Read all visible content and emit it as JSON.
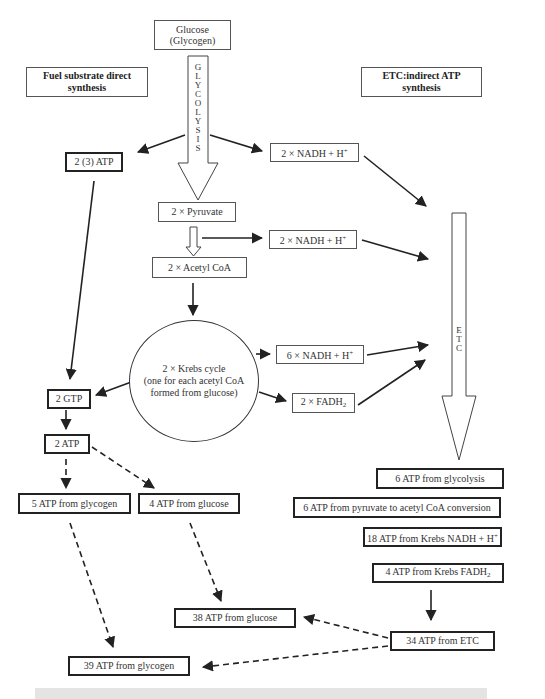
{
  "diagram": {
    "source": {
      "line1": "Glucose",
      "line2": "(Glycogen)"
    },
    "headers": {
      "left": "Fuel substrate direct synthesis",
      "right": "ETC:indirect ATP synthesis"
    },
    "glycolysis_label": [
      "G",
      "L",
      "Y",
      "C",
      "O",
      "L",
      "Y",
      "S",
      "I",
      "S"
    ],
    "etc_label": [
      "E",
      "T",
      "C"
    ],
    "nodes": {
      "atp_glycolysis": "2 (3) ATP",
      "nadh_glycolysis": "2 × NADH + H",
      "pyruvate": "2 × Pyruvate",
      "nadh_pyruvate": "2 × NADH + H",
      "acetyl_coa": "2 × Acetyl CoA",
      "krebs_line1": "2 × Krebs cycle",
      "krebs_line2": "(one for each acetyl CoA",
      "krebs_line3": "formed from glucose)",
      "nadh_krebs": "6 × NADH + H",
      "fadh2_krebs": "2 × FADH",
      "gtp": "2 GTP",
      "atp_from_gtp": "2 ATP",
      "atp_glycogen_direct": "5 ATP from glycogen",
      "atp_glucose_direct": "4 ATP from glucose",
      "total_glucose": "38 ATP from glucose",
      "total_glycogen": "39 ATP from glycogen",
      "etc_glycolysis": "6 ATP from glycolysis",
      "etc_pyruvate": "6 ATP from pyruvate to acetyl CoA conversion",
      "etc_krebs_nadh": "18 ATP from Krebs NADH + H",
      "etc_krebs_fadh2": "4 ATP from Krebs FADH",
      "etc_total": "34 ATP from ETC"
    },
    "superscript_plus": "+",
    "subscript_two": "2"
  }
}
